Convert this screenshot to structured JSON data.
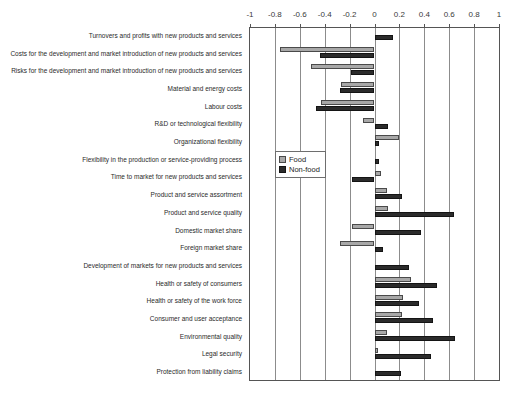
{
  "chart_data": {
    "type": "bar",
    "orientation": "horizontal",
    "title": "",
    "xlabel": "",
    "ylabel": "",
    "xlim": [
      -1,
      1
    ],
    "xticks": [
      -1,
      -0.8,
      -0.6,
      -0.4,
      -0.2,
      0,
      0.2,
      0.4,
      0.6,
      0.8,
      1
    ],
    "xticklabels": [
      "-1",
      "-0.8",
      "-0.6",
      "-0.4",
      "-0.2",
      "0",
      "0.2",
      "0.4",
      "0.6",
      "0.8",
      "1"
    ],
    "grid": true,
    "grid_axis": "x",
    "legend_position": "center-left-inside",
    "categories": [
      "Turnovers and profits with new products and services",
      "Costs for the development and market introduction of new products and services",
      "Risks for the development and market introduction of new products and services",
      "Material and energy costs",
      "Labour costs",
      "R&D or technological flexibility",
      "Organizational flexibility",
      "Flexibility in the production or service-providing process",
      "Time to market for new products and services",
      "Product and service assortment",
      "Product and service quality",
      "Domestic market share",
      "Foreign market share",
      "Development of markets for new products and services",
      "Health or safety of consumers",
      "Health or safety of the work force",
      "Consumer and user acceptance",
      "Environmental quality",
      "Legal security",
      "Protection from liability claims"
    ],
    "series": [
      {
        "name": "Food",
        "color": "#a8a8a8",
        "values": [
          0.0,
          -0.76,
          -0.51,
          -0.27,
          -0.43,
          -0.09,
          0.2,
          0.0,
          0.05,
          0.1,
          0.11,
          -0.18,
          -0.28,
          0.0,
          0.29,
          0.23,
          0.22,
          0.1,
          0.03,
          0.0
        ]
      },
      {
        "name": "Non-food",
        "color": "#2b2b2b",
        "values": [
          0.15,
          -0.44,
          -0.19,
          -0.28,
          -0.47,
          0.11,
          0.04,
          0.04,
          -0.18,
          0.22,
          0.64,
          0.37,
          0.07,
          0.28,
          0.5,
          0.36,
          0.47,
          0.65,
          0.45,
          0.21
        ]
      }
    ]
  },
  "legend": {
    "items": [
      {
        "label": "Food"
      },
      {
        "label": "Non-food"
      }
    ]
  }
}
